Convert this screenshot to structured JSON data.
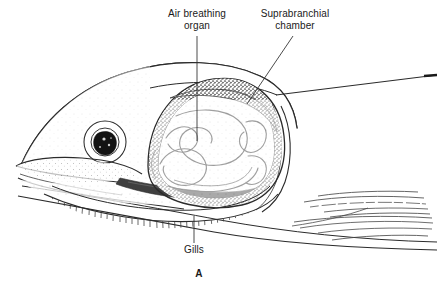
{
  "figure": {
    "panel_letter": "A",
    "labels": {
      "air_breathing_organ": {
        "line1": "Air breathing",
        "line2": "organ"
      },
      "suprabranchial_chamber": {
        "line1": "Suprabranchial",
        "line2": "chamber"
      },
      "gills": "Gills"
    },
    "colors": {
      "ink": "#1a1a1a",
      "line": "#2b2b2b",
      "stipple": "#555555",
      "background": "#ffffff",
      "pupil": "#141414"
    }
  }
}
